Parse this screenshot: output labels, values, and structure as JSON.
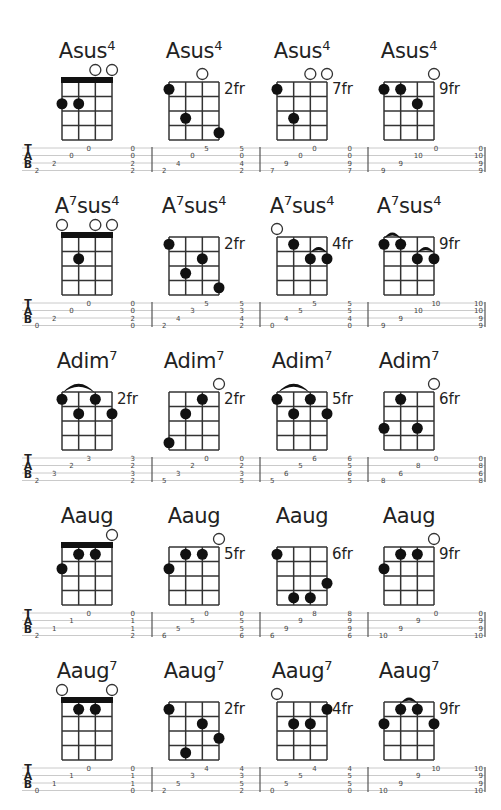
{
  "page": {
    "tab_letters": [
      "T",
      "A",
      "B"
    ]
  },
  "rows": [
    {
      "chords": [
        {
          "root": "A",
          "sup_mid": "",
          "name": "sus",
          "sup": "4",
          "fret_label": "",
          "nut": true,
          "open": [
            2,
            3
          ],
          "dots": [
            [
              0,
              2
            ],
            [
              1,
              2
            ]
          ],
          "arcs": [],
          "tab": [
            "0",
            "0",
            "2",
            "2"
          ]
        },
        {
          "root": "A",
          "sup_mid": "",
          "name": "sus",
          "sup": "4",
          "fret_label": "2fr",
          "nut": false,
          "open": [
            2
          ],
          "dots": [
            [
              0,
              1
            ],
            [
              1,
              3
            ],
            [
              3,
              4
            ]
          ],
          "arcs": [],
          "tab": [
            "5",
            "0",
            "4",
            "2"
          ]
        },
        {
          "root": "A",
          "sup_mid": "",
          "name": "sus",
          "sup": "4",
          "fret_label": "7fr",
          "nut": false,
          "open": [
            2,
            3
          ],
          "dots": [
            [
              0,
              1
            ],
            [
              1,
              3
            ]
          ],
          "arcs": [],
          "tab": [
            "0",
            "0",
            "9",
            "7"
          ]
        },
        {
          "root": "A",
          "sup_mid": "",
          "name": "sus",
          "sup": "4",
          "fret_label": "9fr",
          "nut": false,
          "open": [
            3
          ],
          "dots": [
            [
              0,
              1
            ],
            [
              1,
              1
            ],
            [
              2,
              2
            ]
          ],
          "arcs": [],
          "tab": [
            "0",
            "10",
            "9",
            "9"
          ]
        }
      ]
    },
    {
      "chords": [
        {
          "root": "A",
          "sup_mid": "7",
          "name": "sus",
          "sup": "4",
          "fret_label": "",
          "nut": true,
          "open": [
            0,
            2,
            3
          ],
          "dots": [
            [
              1,
              2
            ]
          ],
          "arcs": [],
          "tab": [
            "0",
            "0",
            "2",
            "0"
          ]
        },
        {
          "root": "A",
          "sup_mid": "7",
          "name": "sus",
          "sup": "4",
          "fret_label": "2fr",
          "nut": false,
          "open": [],
          "dots": [
            [
              0,
              1
            ],
            [
              2,
              2
            ],
            [
              1,
              3
            ],
            [
              3,
              4
            ]
          ],
          "arcs": [],
          "tab": [
            "5",
            "3",
            "4",
            "2"
          ]
        },
        {
          "root": "A",
          "sup_mid": "7",
          "name": "sus",
          "sup": "4",
          "fret_label": "4fr",
          "nut": false,
          "open": [
            0
          ],
          "dots": [
            [
              1,
              1
            ],
            [
              2,
              2
            ],
            [
              3,
              2
            ]
          ],
          "arcs": [
            [
              2,
              3,
              2
            ]
          ],
          "tab": [
            "5",
            "5",
            "4",
            "0"
          ]
        },
        {
          "root": "A",
          "sup_mid": "7",
          "name": "sus",
          "sup": "4",
          "fret_label": "9fr",
          "nut": false,
          "open": [],
          "dots": [
            [
              0,
              1
            ],
            [
              1,
              1
            ],
            [
              2,
              2
            ],
            [
              3,
              2
            ]
          ],
          "arcs": [
            [
              0,
              1,
              1
            ],
            [
              2,
              3,
              2
            ]
          ],
          "tab": [
            "10",
            "10",
            "9",
            "9"
          ]
        }
      ]
    },
    {
      "chords": [
        {
          "root": "A",
          "sup_mid": "",
          "name": "dim",
          "sup": "7",
          "fret_label": "2fr",
          "nut": false,
          "open": [],
          "dots": [
            [
              0,
              1
            ],
            [
              2,
              1
            ],
            [
              1,
              2
            ],
            [
              3,
              2
            ]
          ],
          "arcs": [
            [
              0,
              2,
              1
            ]
          ],
          "tab": [
            "3",
            "2",
            "3",
            "2"
          ]
        },
        {
          "root": "A",
          "sup_mid": "",
          "name": "dim",
          "sup": "7",
          "fret_label": "2fr",
          "nut": false,
          "open": [
            3
          ],
          "dots": [
            [
              2,
              1
            ],
            [
              1,
              2
            ],
            [
              0,
              4
            ]
          ],
          "arcs": [],
          "tab": [
            "0",
            "2",
            "3",
            "5"
          ]
        },
        {
          "root": "A",
          "sup_mid": "",
          "name": "dim",
          "sup": "7",
          "fret_label": "5fr",
          "nut": false,
          "open": [],
          "dots": [
            [
              0,
              1
            ],
            [
              2,
              1
            ],
            [
              1,
              2
            ],
            [
              3,
              2
            ]
          ],
          "arcs": [
            [
              0,
              2,
              1
            ]
          ],
          "tab": [
            "6",
            "5",
            "6",
            "5"
          ]
        },
        {
          "root": "A",
          "sup_mid": "",
          "name": "dim",
          "sup": "7",
          "fret_label": "6fr",
          "nut": false,
          "open": [
            3
          ],
          "dots": [
            [
              1,
              1
            ],
            [
              0,
              3
            ],
            [
              2,
              3
            ]
          ],
          "arcs": [],
          "tab": [
            "0",
            "8",
            "6",
            "8"
          ]
        }
      ]
    },
    {
      "chords": [
        {
          "root": "A",
          "sup_mid": "",
          "name": "aug",
          "sup": "",
          "fret_label": "",
          "nut": true,
          "open": [
            3
          ],
          "dots": [
            [
              1,
              1
            ],
            [
              2,
              1
            ],
            [
              0,
              2
            ]
          ],
          "arcs": [],
          "tab": [
            "0",
            "1",
            "1",
            "2"
          ]
        },
        {
          "root": "A",
          "sup_mid": "",
          "name": "aug",
          "sup": "",
          "fret_label": "5fr",
          "nut": false,
          "open": [
            3
          ],
          "dots": [
            [
              1,
              1
            ],
            [
              2,
              1
            ],
            [
              0,
              2
            ]
          ],
          "arcs": [],
          "tab": [
            "0",
            "5",
            "5",
            "6"
          ]
        },
        {
          "root": "A",
          "sup_mid": "",
          "name": "aug",
          "sup": "",
          "fret_label": "6fr",
          "nut": false,
          "open": [],
          "dots": [
            [
              0,
              1
            ],
            [
              3,
              3
            ],
            [
              1,
              4
            ],
            [
              2,
              4
            ]
          ],
          "arcs": [],
          "tab": [
            "8",
            "9",
            "9",
            "6"
          ]
        },
        {
          "root": "A",
          "sup_mid": "",
          "name": "aug",
          "sup": "",
          "fret_label": "9fr",
          "nut": false,
          "open": [
            3
          ],
          "dots": [
            [
              1,
              1
            ],
            [
              2,
              1
            ],
            [
              0,
              2
            ]
          ],
          "arcs": [],
          "tab": [
            "0",
            "9",
            "9",
            "10"
          ]
        }
      ]
    },
    {
      "chords": [
        {
          "root": "A",
          "sup_mid": "",
          "name": "aug",
          "sup": "7",
          "fret_label": "",
          "nut": true,
          "open": [
            0,
            3
          ],
          "dots": [
            [
              1,
              1
            ],
            [
              2,
              1
            ]
          ],
          "arcs": [],
          "tab": [
            "0",
            "1",
            "1",
            "0"
          ]
        },
        {
          "root": "A",
          "sup_mid": "",
          "name": "aug",
          "sup": "7",
          "fret_label": "2fr",
          "nut": false,
          "open": [],
          "dots": [
            [
              0,
              1
            ],
            [
              2,
              2
            ],
            [
              3,
              3
            ],
            [
              1,
              4
            ]
          ],
          "arcs": [],
          "tab": [
            "4",
            "3",
            "5",
            "2"
          ]
        },
        {
          "root": "A",
          "sup_mid": "",
          "name": "aug",
          "sup": "7",
          "fret_label": "4fr",
          "nut": false,
          "open": [
            0
          ],
          "dots": [
            [
              3,
              1
            ],
            [
              1,
              2
            ],
            [
              2,
              2
            ]
          ],
          "arcs": [],
          "tab": [
            "4",
            "5",
            "5",
            "0"
          ]
        },
        {
          "root": "A",
          "sup_mid": "",
          "name": "aug",
          "sup": "7",
          "fret_label": "9fr",
          "nut": false,
          "open": [],
          "dots": [
            [
              1,
              1
            ],
            [
              2,
              1
            ],
            [
              0,
              2
            ],
            [
              3,
              2
            ]
          ],
          "arcs": [
            [
              1,
              2,
              1
            ]
          ],
          "tab": [
            "10",
            "9",
            "9",
            "10"
          ]
        }
      ]
    }
  ]
}
